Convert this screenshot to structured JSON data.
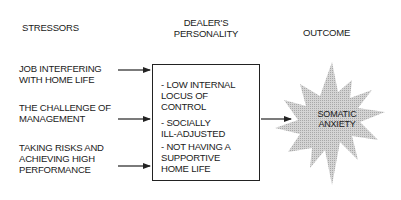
{
  "headers": {
    "stressors": "STRESSORS",
    "personality": "DEALER'S\nPERSONALITY",
    "outcome": "OUTCOME"
  },
  "stressors": [
    {
      "label": "JOB INTERFERING\nWITH HOME LIFE"
    },
    {
      "label": "THE CHALLENGE OF\nMANAGEMENT"
    },
    {
      "label": "TAKING RISKS AND\nACHIEVING HIGH\nPERFORMANCE"
    }
  ],
  "personality_traits": [
    {
      "label": "- LOW INTERNAL\n  LOCUS OF\n  CONTROL"
    },
    {
      "label": "- SOCIALLY\n  ILL-ADJUSTED"
    },
    {
      "label": "- NOT HAVING A\n  SUPPORTIVE\n  HOME LIFE"
    }
  ],
  "outcome": {
    "label": "SOMATIC\nANXIETY",
    "shape": "starburst",
    "fill_color": "#c8c8c8"
  },
  "colors": {
    "line": "#222222",
    "text": "#1a1a1a",
    "background": "#ffffff"
  }
}
